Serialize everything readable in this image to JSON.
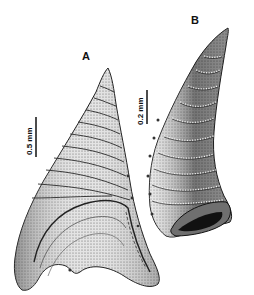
{
  "figure": {
    "panels": [
      {
        "label": "A",
        "scale_bar": "0.5 mm"
      },
      {
        "label": "B",
        "scale_bar": "0.2 mm"
      }
    ]
  },
  "colors": {
    "ink": "#111111",
    "mid": "#6a6a6a",
    "light": "#d6d6d6",
    "background": "#ffffff"
  }
}
